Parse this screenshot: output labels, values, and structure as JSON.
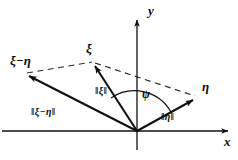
{
  "figure": {
    "kind": "vector-diagram",
    "background_color": "#ffffff",
    "stroke_color": "#111111",
    "title": "",
    "axes": {
      "x_label": "x",
      "y_label": "y",
      "origin": {
        "x": 137,
        "y": 131
      },
      "x_axis": {
        "x1": 2,
        "y1": 131,
        "x2": 230,
        "y2": 131,
        "arrow": "right"
      },
      "y_axis": {
        "x1": 137,
        "y1": 148,
        "x2": 137,
        "y2": 18,
        "arrow": "up"
      }
    },
    "vectors": [
      {
        "name": "xi",
        "label": "ξ",
        "magnitude_label": "‖ξ‖",
        "style": "solid",
        "from": {
          "x": 137,
          "y": 131
        },
        "to": {
          "x": 93,
          "y": 62
        }
      },
      {
        "name": "eta",
        "label": "η",
        "magnitude_label": "‖η‖",
        "style": "solid",
        "from": {
          "x": 137,
          "y": 131
        },
        "to": {
          "x": 197,
          "y": 97
        }
      },
      {
        "name": "xi-minus-eta",
        "label": "ξ−η",
        "magnitude_label": "‖ξ−η‖",
        "style": "solid",
        "from": {
          "x": 137,
          "y": 131
        },
        "to": {
          "x": 25,
          "y": 74
        }
      }
    ],
    "construction_lines": [
      {
        "name": "xi-to-eta-dashed",
        "style": "dashed",
        "from": {
          "x": 93,
          "y": 62
        },
        "to": {
          "x": 197,
          "y": 97
        }
      },
      {
        "name": "xi-minus-eta-to-xi-dashed",
        "style": "dashed",
        "from": {
          "x": 25,
          "y": 73
        },
        "to": {
          "x": 93,
          "y": 62
        }
      }
    ],
    "angle": {
      "name": "psi",
      "label": "ψ",
      "between": [
        "xi",
        "eta"
      ],
      "arc_radius": 40
    }
  }
}
